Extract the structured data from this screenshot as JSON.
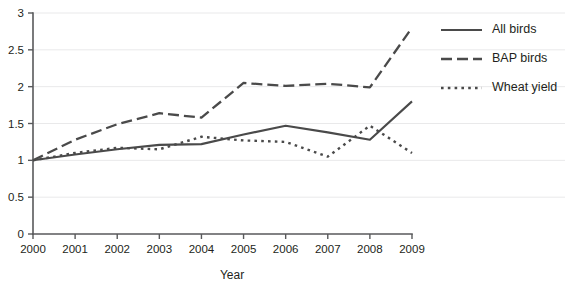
{
  "chart_data": {
    "type": "line",
    "title": "",
    "subtitle": "",
    "xlabel": "Year",
    "ylabel": "",
    "categories": [
      "2000",
      "2001",
      "2002",
      "2003",
      "2004",
      "2005",
      "2006",
      "2007",
      "2008",
      "2009"
    ],
    "x": [
      2000,
      2001,
      2002,
      2003,
      2004,
      2005,
      2006,
      2007,
      2008,
      2009
    ],
    "xlim": [
      2000,
      2009
    ],
    "ylim": [
      0,
      3
    ],
    "ytick_labels": [
      "0",
      "0.5",
      "1",
      "1.5",
      "2",
      "2.5",
      "3"
    ],
    "yticks": [
      0,
      0.5,
      1,
      1.5,
      2,
      2.5,
      3
    ],
    "grid": "horizontal",
    "legend_position": "right",
    "series": [
      {
        "name": "All birds",
        "style": "solid",
        "color": "#4a4a4a",
        "values": [
          1.0,
          1.08,
          1.15,
          1.21,
          1.22,
          1.35,
          1.47,
          1.38,
          1.28,
          1.8
        ]
      },
      {
        "name": "BAP birds",
        "style": "dashed",
        "color": "#4a4a4a",
        "values": [
          1.0,
          1.28,
          1.49,
          1.64,
          1.58,
          2.05,
          2.01,
          2.04,
          1.99,
          2.8
        ]
      },
      {
        "name": "Wheat yield",
        "style": "dotted",
        "color": "#4a4a4a",
        "values": [
          1.0,
          1.1,
          1.17,
          1.15,
          1.32,
          1.27,
          1.25,
          1.05,
          1.47,
          1.1
        ]
      }
    ]
  },
  "legend": {
    "items": [
      {
        "label": "All birds",
        "style": "solid"
      },
      {
        "label": "BAP birds",
        "style": "dashed"
      },
      {
        "label": "Wheat yield",
        "style": "dotted"
      }
    ]
  },
  "axes": {
    "x_title": "Year"
  }
}
